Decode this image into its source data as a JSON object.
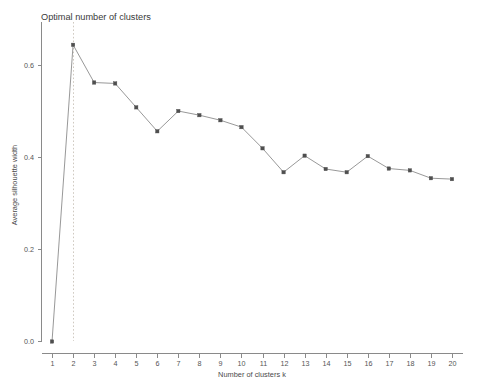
{
  "chart_data": {
    "type": "line",
    "title": "Optimal number of clusters",
    "xlabel": "Number of clusters k",
    "ylabel": "Average silhouette width",
    "x": [
      1,
      2,
      3,
      4,
      5,
      6,
      7,
      8,
      9,
      10,
      11,
      12,
      13,
      14,
      15,
      16,
      17,
      18,
      19,
      20
    ],
    "values": [
      0.0,
      0.645,
      0.563,
      0.561,
      0.509,
      0.457,
      0.501,
      0.492,
      0.481,
      0.466,
      0.42,
      0.368,
      0.404,
      0.375,
      0.368,
      0.403,
      0.376,
      0.372,
      0.355,
      0.353
    ],
    "xtick_labels": [
      "1",
      "2",
      "3",
      "4",
      "5",
      "6",
      "7",
      "8",
      "9",
      "10",
      "11",
      "12",
      "13",
      "14",
      "15",
      "16",
      "17",
      "18",
      "19",
      "20"
    ],
    "ytick_labels": [
      "0.0",
      "0.2",
      "0.4",
      "0.6"
    ],
    "ytick_values": [
      0.0,
      0.2,
      0.4,
      0.6
    ],
    "xlim": [
      0.5,
      20.5
    ],
    "ylim": [
      -0.02,
      0.68
    ],
    "grid": false,
    "legend": false,
    "annotations": [
      {
        "name": "optimal-k-reference-line",
        "type": "vertical-dashed-line",
        "x": 2,
        "color": "#cfc9c0"
      }
    ],
    "series_color": "#8c8c8c",
    "marker_color": "#4f4f4f"
  }
}
